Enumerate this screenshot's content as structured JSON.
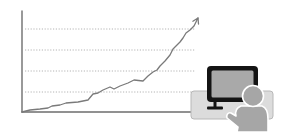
{
  "illustration": {
    "subject": "growth chart with person at computer",
    "colors": {
      "background": "#ffffff",
      "axis": "#6e6e6e",
      "grid": "#b4b4b4",
      "trend_line": "#7a7a7a",
      "desk_panel_fill": "#dcdcdc",
      "desk_panel_stroke": "#b8b8b8",
      "monitor_frame": "#141414",
      "monitor_screen": "#a9a9a9",
      "person_fill": "#a6a6a6",
      "person_stroke": "#ffffff"
    }
  },
  "chart_data": {
    "type": "line",
    "title": "",
    "xlabel": "",
    "ylabel": "",
    "grid": true,
    "gridlines_y_px": [
      29,
      50,
      71,
      92
    ],
    "axis": {
      "origin": [
        22,
        112
      ],
      "x_end": 192,
      "y_top": 11
    },
    "trend_arrow": true,
    "points_px": [
      [
        22,
        112
      ],
      [
        30,
        110
      ],
      [
        40,
        109
      ],
      [
        48,
        108
      ],
      [
        52,
        106
      ],
      [
        60,
        105
      ],
      [
        66,
        103
      ],
      [
        78,
        102
      ],
      [
        88,
        100
      ],
      [
        93,
        94
      ],
      [
        98,
        93
      ],
      [
        103,
        90
      ],
      [
        110,
        87
      ],
      [
        114,
        89
      ],
      [
        120,
        86
      ],
      [
        128,
        83
      ],
      [
        134,
        80
      ],
      [
        143,
        81
      ],
      [
        148,
        76
      ],
      [
        153,
        72
      ],
      [
        157,
        70
      ],
      [
        160,
        66
      ],
      [
        165,
        61
      ],
      [
        170,
        55
      ],
      [
        173,
        49
      ],
      [
        176,
        46
      ],
      [
        180,
        42
      ],
      [
        183,
        38
      ],
      [
        186,
        33
      ],
      [
        190,
        30
      ],
      [
        194,
        26
      ],
      [
        198,
        18
      ]
    ],
    "series_trend": "increasing"
  }
}
